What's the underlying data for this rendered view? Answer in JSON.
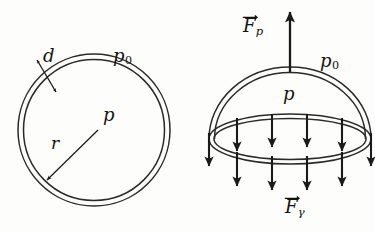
{
  "figure": {
    "ink_color": "#1a1a1a",
    "background_color": "#fdfdfc",
    "panels": [
      {
        "name": "full-bubble-cross-section",
        "description": "Double circle representing a soap bubble wall of thickness d and radius r"
      },
      {
        "name": "hemisphere-force-balance",
        "description": "Hemispherical half of the bubble with pressure force up and surface-tension forces down"
      }
    ]
  },
  "left_panel": {
    "labels": {
      "thickness": "d",
      "outside_pressure": "p",
      "outside_pressure_sub": "0",
      "inside_pressure": "p",
      "radius": "r"
    }
  },
  "right_panel": {
    "labels": {
      "pressure_force": "F",
      "pressure_force_sub": "p",
      "outside_pressure": "p",
      "outside_pressure_sub": "0",
      "inside_pressure": "p",
      "tension_force": "F",
      "tension_force_sub": "γ"
    },
    "arrow_counts": {
      "up_arrows": 1,
      "inner_down_arrows": 4,
      "outer_down_arrows": 2,
      "lower_down_arrows": 4
    }
  }
}
